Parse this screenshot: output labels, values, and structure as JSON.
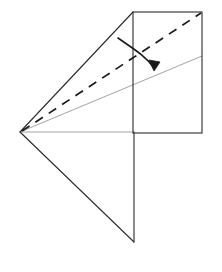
{
  "figure": {
    "kind": "origami-fold-diagram",
    "width": 222,
    "height": 272,
    "background_color": "#ffffff",
    "title": "",
    "caption": "",
    "labels": []
  },
  "style": {
    "edge_color": "#2b2b2b",
    "edge_width": 1.1,
    "crease_color": "#1a1a1a",
    "crease_width": 1.7,
    "crease_dash": "9 7",
    "guide_color": "#9a9a9a",
    "guide_width": 0.9,
    "arrow_color": "#1a1a1a",
    "arrow_width": 1.6
  },
  "geometry": {
    "points": {
      "apex": {
        "x": 20,
        "y": 132
      },
      "rect_top_left": {
        "x": 133,
        "y": 12
      },
      "rect_top_right": {
        "x": 202,
        "y": 12
      },
      "rect_bottom_right": {
        "x": 202,
        "y": 133
      },
      "rect_bottom_left": {
        "x": 133,
        "y": 133
      },
      "lower_tip": {
        "x": 134,
        "y": 242
      },
      "guide_right": {
        "x": 202,
        "y": 56
      },
      "crease_right": {
        "x": 201,
        "y": 13
      }
    },
    "shapes": [
      {
        "name": "paper-rectangle",
        "kind": "rect",
        "x": 133,
        "y": 12,
        "width": 69,
        "height": 121,
        "stroke": "#2b2b2b",
        "fill": "none"
      },
      {
        "name": "upper-flap-edge",
        "kind": "polyline",
        "points": "20,132 133,12",
        "stroke": "#2b2b2b"
      },
      {
        "name": "lower-flap-edge",
        "kind": "polyline",
        "points": "20,132 134,242",
        "stroke": "#2b2b2b"
      },
      {
        "name": "lower-flap-vertical-edge",
        "kind": "polyline",
        "points": "134,242 134,133",
        "stroke": "#2b2b2b"
      },
      {
        "name": "horizontal-guide-line",
        "kind": "polyline",
        "points": "20,132 134,132",
        "stroke": "#9a9a9a"
      },
      {
        "name": "diagonal-guide-line",
        "kind": "polyline",
        "points": "20,132 202,56",
        "stroke": "#9a9a9a"
      },
      {
        "name": "valley-crease-dashed",
        "kind": "polyline",
        "points": "22,131 201,13",
        "stroke": "#1a1a1a",
        "dashed": true
      }
    ],
    "arrow": {
      "name": "fold-direction-arrow",
      "path": "M 118,38 C 132,48 146,56 154,68",
      "head": "M 154,71 L 149,60 L 160,62 Z",
      "tail_x": 118,
      "tail_y": 38,
      "tip_x": 156,
      "tip_y": 71
    }
  }
}
